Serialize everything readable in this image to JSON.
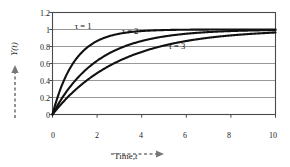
{
  "chart_data": {
    "type": "line",
    "title": "",
    "xlabel": "Time, t",
    "ylabel": "Y(t)",
    "xlim": [
      0,
      10
    ],
    "ylim": [
      0,
      1.2
    ],
    "grid": true,
    "grid_orientation": "horizontal",
    "legend_position": "inline-annotations",
    "xticks": [
      "0",
      "2",
      "4",
      "6",
      "8",
      "10"
    ],
    "xtick_values": [
      0,
      2,
      4,
      6,
      8,
      10
    ],
    "yticks": [
      "0",
      "0.2",
      "0.4",
      "0.6",
      "0.8",
      "1",
      "1.2"
    ],
    "ytick_values": [
      0,
      0.2,
      0.4,
      0.6,
      0.8,
      1,
      1.2
    ],
    "equation": "Y(t) = 1 - exp(-t/tau)",
    "x": [
      0,
      0.25,
      0.5,
      0.75,
      1,
      1.5,
      2,
      2.5,
      3,
      3.5,
      4,
      4.5,
      5,
      6,
      7,
      8,
      9,
      10
    ],
    "series": [
      {
        "name": "τ = 1",
        "tau": 1,
        "color": "#111111",
        "label_x": 1.0,
        "label_y": 1.03,
        "values": [
          0,
          0.221,
          0.393,
          0.528,
          0.632,
          0.777,
          0.865,
          0.918,
          0.95,
          0.97,
          0.982,
          0.989,
          0.993,
          0.998,
          0.999,
          1.0,
          1.0,
          1.0
        ]
      },
      {
        "name": "τ = 2",
        "tau": 2,
        "color": "#111111",
        "label_x": 3.1,
        "label_y": 0.97,
        "values": [
          0,
          0.118,
          0.221,
          0.313,
          0.393,
          0.528,
          0.632,
          0.713,
          0.777,
          0.826,
          0.865,
          0.895,
          0.918,
          0.95,
          0.97,
          0.982,
          0.989,
          0.993
        ]
      },
      {
        "name": "τ = 3",
        "tau": 3,
        "color": "#111111",
        "label_x": 5.2,
        "label_y": 0.79,
        "values": [
          0,
          0.08,
          0.154,
          0.221,
          0.283,
          0.393,
          0.487,
          0.565,
          0.632,
          0.688,
          0.736,
          0.777,
          0.811,
          0.865,
          0.905,
          0.936,
          0.95,
          0.964
        ]
      }
    ]
  },
  "axes": {
    "ylabel_display": "Y(t)",
    "xlabel_display": "Time,",
    "xlabel_var": "t"
  }
}
